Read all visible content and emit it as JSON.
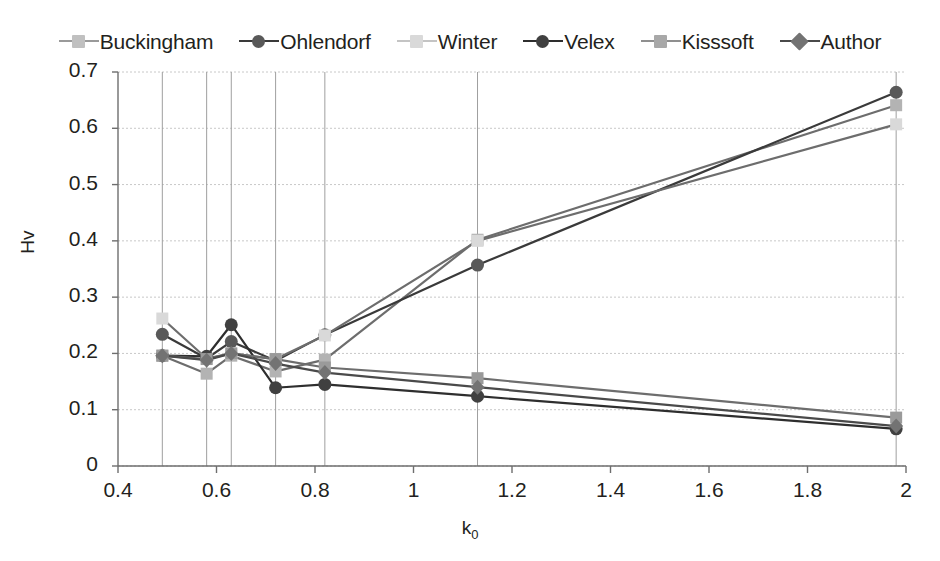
{
  "chart_data": {
    "type": "line",
    "title": "",
    "xlabel": "k0",
    "xlabel_base": "k",
    "xlabel_sub": "0",
    "ylabel": "Hv",
    "xlim": [
      0.4,
      2.0
    ],
    "ylim": [
      0,
      0.7
    ],
    "xticks": [
      "0.4",
      "0.6",
      "0.8",
      "1",
      "1.2",
      "1.4",
      "1.6",
      "1.8",
      "2"
    ],
    "xtick_values": [
      0.4,
      0.6,
      0.8,
      1.0,
      1.2,
      1.4,
      1.6,
      1.8,
      2.0
    ],
    "yticks": [
      "0",
      "0.1",
      "0.2",
      "0.3",
      "0.4",
      "0.5",
      "0.6",
      "0.7"
    ],
    "ytick_values": [
      0,
      0.1,
      0.2,
      0.3,
      0.4,
      0.5,
      0.6,
      0.7
    ],
    "grid": true,
    "legend_position": "top",
    "x": [
      0.49,
      0.58,
      0.63,
      0.72,
      0.82,
      1.13,
      1.98
    ],
    "series": [
      {
        "name": "Buckingham",
        "marker": "square",
        "color": "#b3b3b3",
        "line_color": "#6d6d6d",
        "values": [
          0.196,
          0.164,
          0.196,
          0.168,
          0.189,
          0.402,
          0.641
        ]
      },
      {
        "name": "Ohlendorf",
        "marker": "circle",
        "color": "#595959",
        "line_color": "#3a3a3a",
        "values": [
          0.234,
          0.191,
          0.221,
          0.187,
          0.233,
          0.357,
          0.664
        ]
      },
      {
        "name": "Winter",
        "marker": "square",
        "color": "#d9d9d9",
        "line_color": "#6d6d6d",
        "values": [
          0.262,
          0.191,
          0.2,
          0.19,
          0.232,
          0.4,
          0.607
        ]
      },
      {
        "name": "Velex",
        "marker": "circle",
        "color": "#404040",
        "line_color": "#2e2e2e",
        "values": [
          0.196,
          0.195,
          0.251,
          0.139,
          0.145,
          0.124,
          0.066
        ]
      },
      {
        "name": "Kisssoft",
        "marker": "square",
        "color": "#9a9a9a",
        "line_color": "#6d6d6d",
        "values": [
          0.196,
          0.19,
          0.2,
          0.19,
          0.175,
          0.156,
          0.086
        ]
      },
      {
        "name": "Author",
        "marker": "diamond",
        "color": "#737373",
        "line_color": "#4a4a4a",
        "values": [
          0.196,
          0.188,
          0.2,
          0.182,
          0.166,
          0.14,
          0.071
        ]
      }
    ],
    "annotations": [
      {
        "label": "Transfer 2",
        "x": 0.49
      },
      {
        "label": "H501",
        "x": 0.58
      },
      {
        "label": "C40",
        "x": 0.63
      },
      {
        "label": "Transfer 1",
        "x": 0.72
      },
      {
        "label": "m=8",
        "x": 0.82
      },
      {
        "label": "m=10",
        "x": 1.13
      },
      {
        "label": "H951",
        "x": 1.98
      }
    ],
    "annotation_tops": [
      175,
      195,
      200,
      186,
      200,
      180,
      200
    ]
  },
  "colors": {
    "plot_background": "#ffffff",
    "grid": "#c8c8c8",
    "axis": "#808080",
    "text": "#231f20"
  }
}
